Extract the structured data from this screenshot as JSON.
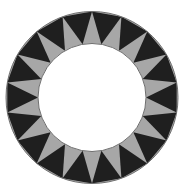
{
  "figure": {
    "title": "",
    "canvas": {
      "width": 185,
      "height": 192,
      "background": "#ffffff"
    },
    "geometry": {
      "center_x": 92,
      "center_y": 97.5,
      "outer_radius_x": 86,
      "outer_radius_y": 86,
      "inner_radius_x": 54,
      "inner_radius_y": 54,
      "segment_count": 18,
      "rotation_offset_deg": -90
    },
    "colors": {
      "dark": "#1f1f1f",
      "gray": "#a7a7a7",
      "inner": "#ffffff",
      "outline": "#6f6f6f",
      "background": "#ffffff"
    },
    "outline_width": 1,
    "pattern": {
      "dark_triangle_orientation": "apex-inward",
      "gray_triangle_orientation": "apex-outward",
      "dark_triangle_count": 18,
      "gray_triangle_count": 18
    }
  },
  "chart_data": {
    "type": "pie",
    "title": "",
    "xlabel": "",
    "ylabel": "",
    "legend": [],
    "categories": [
      "seg-1",
      "seg-2",
      "seg-3",
      "seg-4",
      "seg-5",
      "seg-6",
      "seg-7",
      "seg-8",
      "seg-9",
      "seg-10",
      "seg-11",
      "seg-12",
      "seg-13",
      "seg-14",
      "seg-15",
      "seg-16",
      "seg-17",
      "seg-18"
    ],
    "values": [
      20,
      20,
      20,
      20,
      20,
      20,
      20,
      20,
      20,
      20,
      20,
      20,
      20,
      20,
      20,
      20,
      20,
      20
    ],
    "series": [
      {
        "name": "dark-teeth",
        "color": "#1f1f1f",
        "count": 18,
        "values": [
          20,
          20,
          20,
          20,
          20,
          20,
          20,
          20,
          20,
          20,
          20,
          20,
          20,
          20,
          20,
          20,
          20,
          20
        ]
      },
      {
        "name": "gray-teeth",
        "color": "#a7a7a7",
        "count": 18,
        "values": [
          20,
          20,
          20,
          20,
          20,
          20,
          20,
          20,
          20,
          20,
          20,
          20,
          20,
          20,
          20,
          20,
          20,
          20
        ]
      }
    ],
    "grid": false,
    "legend_position": "none"
  }
}
